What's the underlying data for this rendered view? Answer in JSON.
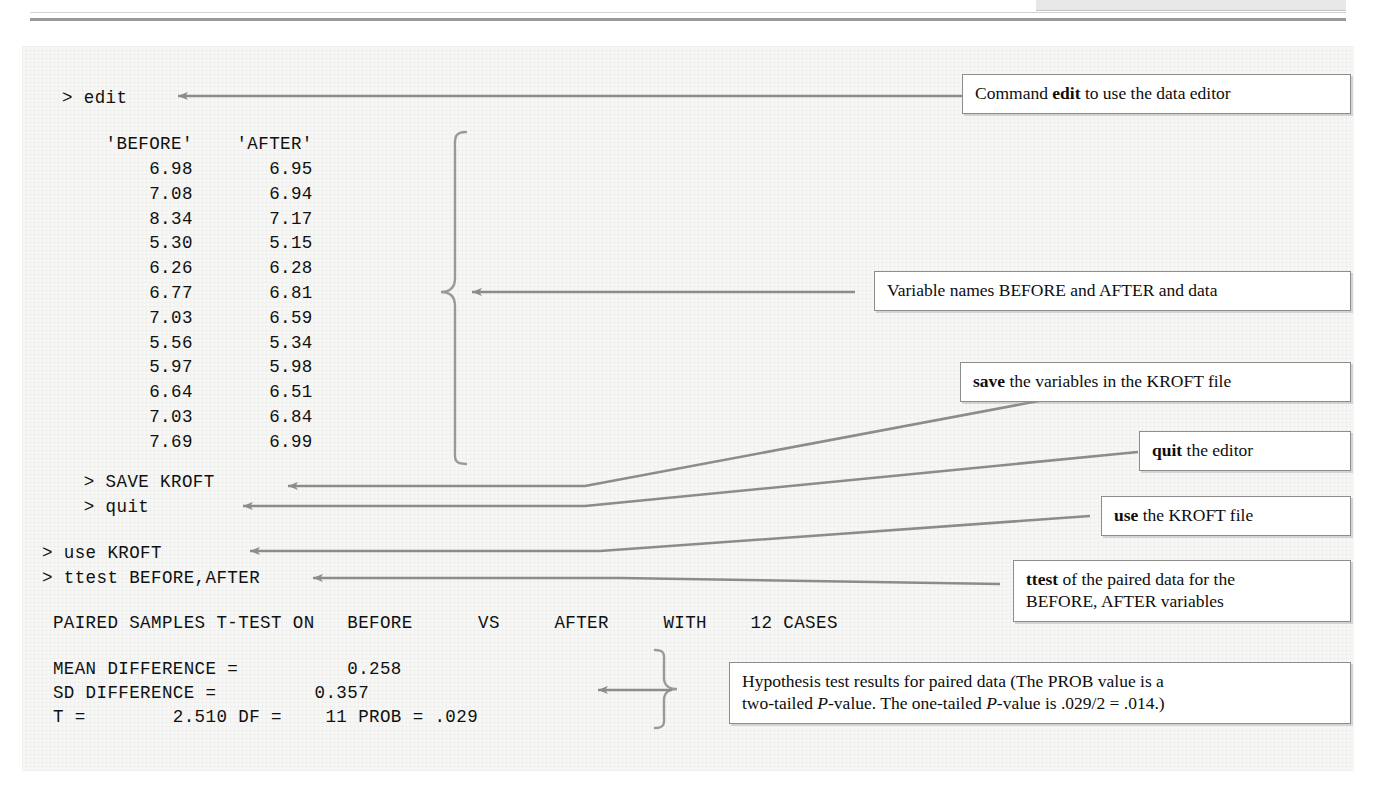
{
  "figure": {
    "kind": "statistics-software-session-annotated-figure",
    "background_note": "scanned graph-paper texture"
  },
  "console": {
    "line_edit": "> edit",
    "table_header": "    'BEFORE'    'AFTER'",
    "data_rows": [
      "        6.98       6.95",
      "        7.08       6.94",
      "        8.34       7.17",
      "        5.30       5.15",
      "        6.26       6.28",
      "        6.77       6.81",
      "        7.03       6.59",
      "        5.56       5.34",
      "        5.97       5.98",
      "        6.64       6.51",
      "        7.03       6.84",
      "        7.69       6.99"
    ],
    "line_save": "  > SAVE KROFT",
    "line_quit": "  > quit",
    "line_use": "> use KROFT",
    "line_ttest": "> ttest BEFORE,AFTER",
    "line_paired_header": " PAIRED SAMPLES T-TEST ON   BEFORE      VS     AFTER     WITH    12 CASES",
    "line_mean_diff": " MEAN DIFFERENCE =          0.258",
    "line_sd_diff": " SD DIFFERENCE =         0.357",
    "line_t_stat": " T =        2.510 DF =    11 PROB = .029"
  },
  "table": {
    "columns": [
      "'BEFORE'",
      "'AFTER'"
    ],
    "before": [
      6.98,
      7.08,
      8.34,
      5.3,
      6.26,
      6.77,
      7.03,
      5.56,
      5.97,
      6.64,
      7.03,
      7.69
    ],
    "after": [
      6.95,
      6.94,
      7.17,
      5.15,
      6.28,
      6.81,
      6.59,
      5.34,
      5.98,
      6.51,
      6.84,
      6.99
    ]
  },
  "results": {
    "title": "PAIRED SAMPLES T-TEST ON   BEFORE      VS     AFTER     WITH    12 CASES",
    "var1": "BEFORE",
    "var2": "AFTER",
    "cases": 12,
    "mean_difference": 0.258,
    "sd_difference": 0.357,
    "t": 2.51,
    "df": 11,
    "prob": ".029"
  },
  "callouts": {
    "edit": {
      "prefix": "Command ",
      "bold": "edit",
      "suffix": " to use the data editor"
    },
    "variables": {
      "text": "Variable names BEFORE and AFTER and data"
    },
    "save": {
      "bold": "save",
      "suffix": " the variables in the KROFT file"
    },
    "quit": {
      "bold": "quit",
      "suffix": " the editor"
    },
    "use": {
      "bold": "use",
      "suffix": " the KROFT file"
    },
    "ttest": {
      "bold": "ttest",
      "line1_suffix": " of the paired data for the",
      "line2": "BEFORE, AFTER variables"
    },
    "hypothesis": {
      "line1": "Hypothesis test results for paired data (The PROB value is a",
      "line2_a": "two-tailed ",
      "line2_italic1": "P",
      "line2_b": "-value. The one-tailed ",
      "line2_italic2": "P",
      "line2_c": "-value is .029/2 = .014.)"
    }
  },
  "colors": {
    "arrow": "#8c8c8c",
    "brace": "#9a9a9a",
    "box_border": "#8d8d8d",
    "panel_bg": "#f7f7f6",
    "text": "#101010"
  }
}
